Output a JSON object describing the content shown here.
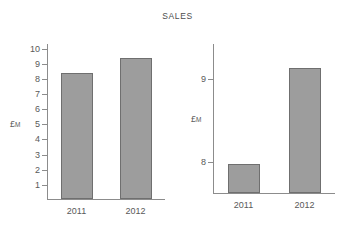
{
  "title": "SALES",
  "axis_unit_label": "£",
  "axis_unit_sub": "M",
  "categories": [
    "2011",
    "2012"
  ],
  "panels": [
    {
      "name": "full-scale",
      "y_ticks": [
        "1",
        "2",
        "3",
        "4",
        "5",
        "6",
        "7",
        "8",
        "9",
        "10"
      ],
      "y_tick_values": [
        1,
        2,
        3,
        4,
        5,
        6,
        7,
        8,
        9,
        10
      ],
      "ymin": 0,
      "ymax": 10.3,
      "values": [
        8.3,
        9.3
      ]
    },
    {
      "name": "truncated-scale",
      "y_ticks": [
        "8",
        "9"
      ],
      "y_tick_values": [
        8,
        9
      ],
      "ymin": 7.62,
      "ymax": 9.42,
      "values": [
        7.97,
        9.12
      ]
    }
  ],
  "chart_data": {
    "type": "bar",
    "title": "SALES",
    "xlabel": "",
    "ylabel": "£M",
    "categories": [
      "2011",
      "2012"
    ],
    "values": [
      8.3,
      9.3
    ],
    "panels": [
      {
        "label": "full-scale",
        "ylim": [
          0,
          10.3
        ],
        "yticks": [
          1,
          2,
          3,
          4,
          5,
          6,
          7,
          8,
          9,
          10
        ],
        "values": [
          8.3,
          9.3
        ],
        "grid": false
      },
      {
        "label": "truncated-scale",
        "ylim": [
          7.62,
          9.42
        ],
        "yticks": [
          8,
          9
        ],
        "values": [
          7.97,
          9.12
        ],
        "grid": false
      }
    ],
    "series": [
      {
        "name": "Sales",
        "values": [
          8.3,
          9.3
        ]
      }
    ],
    "legend": null,
    "colors": {
      "bar_fill": "#9d9d9d",
      "bar_stroke": "#6f6f6f",
      "axis": "#8c8c8c",
      "text": "#595959"
    }
  }
}
